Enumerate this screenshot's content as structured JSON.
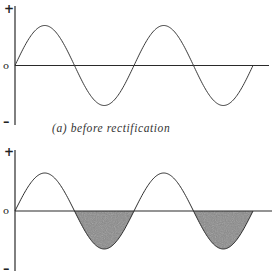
{
  "panels": [
    {
      "id": "before",
      "caption": "(a) before rectification",
      "axis_labels": {
        "plus": "+",
        "zero": "o",
        "minus": "–"
      },
      "shaded_negative": false
    },
    {
      "id": "after",
      "caption": "",
      "axis_labels": {
        "plus": "+",
        "zero": "o",
        "minus": "–"
      },
      "shaded_negative": true
    }
  ],
  "colors": {
    "line": "#3a3a3a",
    "axis": "#2a2a2a",
    "fill": "#8a8a8a"
  },
  "chart_data": [
    {
      "type": "line",
      "title": "(a) before rectification",
      "series": [
        {
          "name": "sine wave",
          "function": "sin(x)",
          "cycles": 2,
          "amplitude": 1
        }
      ],
      "x": [
        0,
        0.25,
        0.5,
        0.75,
        1,
        1.25,
        1.5,
        1.75,
        2
      ],
      "values": [
        0,
        1,
        0,
        -1,
        0,
        1,
        0,
        -1,
        0
      ],
      "xlabel": "",
      "ylabel": "",
      "ytick_labels": [
        "+",
        "o",
        "–"
      ],
      "grid": false
    },
    {
      "type": "area",
      "title": "",
      "series": [
        {
          "name": "sine wave",
          "function": "sin(x)",
          "cycles": 2,
          "amplitude": 1,
          "shaded": "negative half-cycles"
        }
      ],
      "x": [
        0,
        0.25,
        0.5,
        0.75,
        1,
        1.25,
        1.5,
        1.75,
        2
      ],
      "values": [
        0,
        1,
        0,
        -1,
        0,
        1,
        0,
        -1,
        0
      ],
      "xlabel": "",
      "ylabel": "",
      "ytick_labels": [
        "+",
        "o",
        "–"
      ],
      "grid": false
    }
  ]
}
